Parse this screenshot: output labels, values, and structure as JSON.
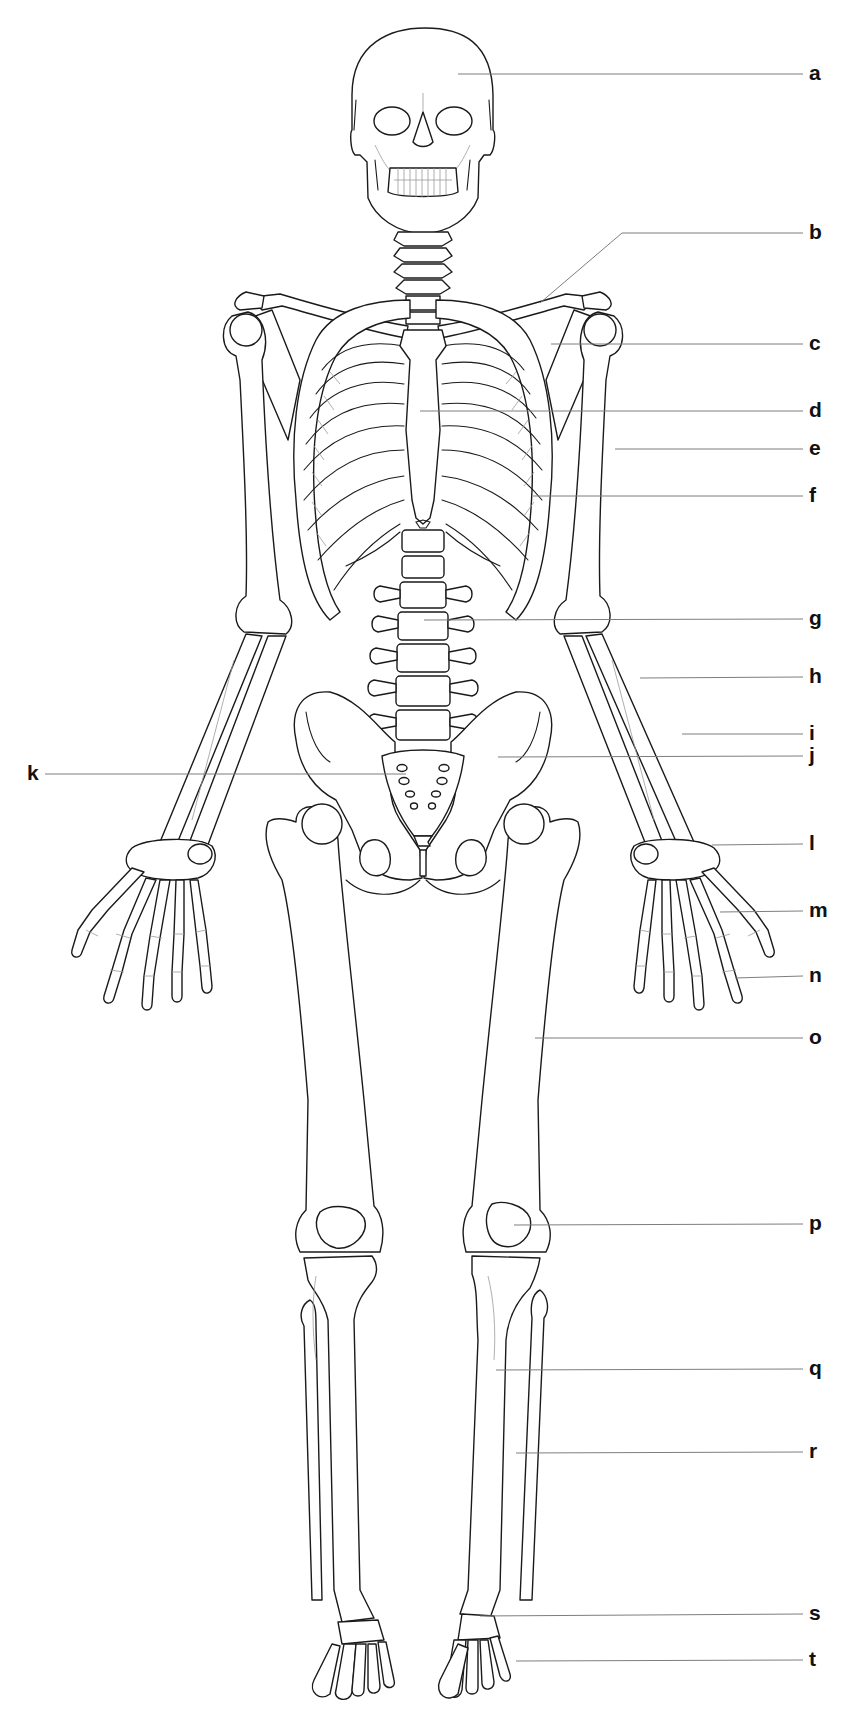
{
  "diagram": {
    "title": "",
    "background_color": "#ffffff",
    "line_color": "#1a1a1a",
    "leader_color": "#7d7d7d",
    "labels": [
      {
        "key": "a",
        "text": "a",
        "side": "right",
        "label_y": 74,
        "target": [
          458,
          74
        ]
      },
      {
        "key": "b",
        "text": "b",
        "side": "right",
        "label_y": 233,
        "target": [
          540,
          303
        ],
        "bend": [
          622,
          233
        ]
      },
      {
        "key": "c",
        "text": "c",
        "side": "right",
        "label_y": 344,
        "target": [
          551,
          344
        ]
      },
      {
        "key": "d",
        "text": "d",
        "side": "right",
        "label_y": 411,
        "target": [
          420,
          411
        ]
      },
      {
        "key": "e",
        "text": "e",
        "side": "right",
        "label_y": 449,
        "target": [
          615,
          449
        ]
      },
      {
        "key": "f",
        "text": "f",
        "side": "right",
        "label_y": 496,
        "target": [
          533,
          496
        ]
      },
      {
        "key": "g",
        "text": "g",
        "side": "right",
        "label_y": 619,
        "target": [
          424,
          620
        ]
      },
      {
        "key": "h",
        "text": "h",
        "side": "right",
        "label_y": 677,
        "target": [
          640,
          678
        ]
      },
      {
        "key": "i",
        "text": "i",
        "side": "right",
        "label_y": 734,
        "target": [
          682,
          734
        ]
      },
      {
        "key": "j",
        "text": "j",
        "side": "right",
        "label_y": 756,
        "target": [
          498,
          757
        ]
      },
      {
        "key": "k",
        "text": "k",
        "side": "left",
        "label_y": 774,
        "target": [
          406,
          774
        ]
      },
      {
        "key": "l",
        "text": "l",
        "side": "right",
        "label_y": 844,
        "target": [
          712,
          845
        ]
      },
      {
        "key": "m",
        "text": "m",
        "side": "right",
        "label_y": 911,
        "target": [
          720,
          912
        ]
      },
      {
        "key": "n",
        "text": "n",
        "side": "right",
        "label_y": 976,
        "target": [
          735,
          978
        ]
      },
      {
        "key": "o",
        "text": "o",
        "side": "right",
        "label_y": 1038,
        "target": [
          535,
          1038
        ]
      },
      {
        "key": "p",
        "text": "p",
        "side": "right",
        "label_y": 1224,
        "target": [
          514,
          1225
        ]
      },
      {
        "key": "q",
        "text": "q",
        "side": "right",
        "label_y": 1369,
        "target": [
          496,
          1370
        ]
      },
      {
        "key": "r",
        "text": "r",
        "side": "right",
        "label_y": 1452,
        "target": [
          516,
          1453
        ]
      },
      {
        "key": "s",
        "text": "s",
        "side": "right",
        "label_y": 1614,
        "target": [
          480,
          1616
        ]
      },
      {
        "key": "t",
        "text": "t",
        "side": "right",
        "label_y": 1660,
        "target": [
          516,
          1661
        ]
      }
    ],
    "label_x_right": 809,
    "leader_end_x_right": 803,
    "label_x_left": 27,
    "leader_start_x_left": 45
  }
}
